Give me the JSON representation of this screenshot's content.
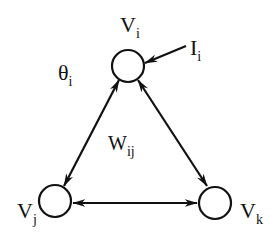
{
  "diagram": {
    "title": "",
    "colors": {
      "stroke": "#111111",
      "background": "#ffffff"
    },
    "nodes": [
      {
        "id": "vi",
        "label_main": "V",
        "label_sub": "i"
      },
      {
        "id": "vj",
        "label_main": "V",
        "label_sub": "j"
      },
      {
        "id": "vk",
        "label_main": "V",
        "label_sub": "k"
      }
    ],
    "edges": [
      {
        "from": "vi",
        "to": "vj",
        "directed": "bidirectional",
        "label_main": "W",
        "label_sub": "ij"
      },
      {
        "from": "vi",
        "to": "vk",
        "directed": "bidirectional"
      },
      {
        "from": "vj",
        "to": "vk",
        "directed": "bidirectional"
      }
    ],
    "input": {
      "target": "vi",
      "label_main": "I",
      "label_sub": "i"
    },
    "threshold": {
      "target": "vi",
      "label_main": "θ",
      "label_sub": "i"
    }
  }
}
